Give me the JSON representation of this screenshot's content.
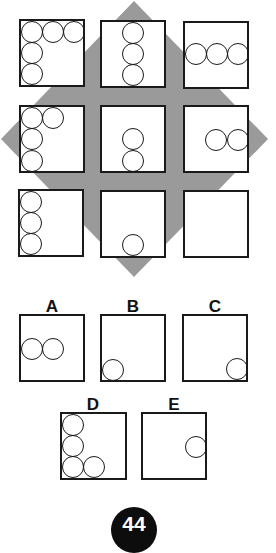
{
  "puzzle": {
    "background_shape": "diamond",
    "diamond_color": "#9a9a9a",
    "grid": [
      {
        "id": "r1c1",
        "circles": [
          "top-left",
          "top-middle",
          "top-right",
          "middle-left",
          "bottom-left"
        ]
      },
      {
        "id": "r1c2",
        "circles": [
          "center-column-top",
          "center-column-middle",
          "center-column-bottom"
        ]
      },
      {
        "id": "r1c3",
        "circles": [
          "middle-row-left",
          "middle-row-center",
          "middle-row-right"
        ]
      },
      {
        "id": "r2c1",
        "circles": [
          "top-left",
          "top-second",
          "middle-left",
          "bottom-left"
        ]
      },
      {
        "id": "r2c2",
        "circles": [
          "center-middle",
          "center-bottom"
        ]
      },
      {
        "id": "r2c3",
        "circles": [
          "middle-center",
          "middle-right"
        ]
      },
      {
        "id": "r3c1",
        "circles": [
          "top-left",
          "middle-left",
          "bottom-left"
        ]
      },
      {
        "id": "r3c2",
        "circles": [
          "bottom-center"
        ]
      },
      {
        "id": "r3c3",
        "circles": [],
        "missing": true
      }
    ]
  },
  "options": [
    {
      "label": "A",
      "circles": [
        "middle-left",
        "middle-second"
      ]
    },
    {
      "label": "B",
      "circles": [
        "bottom-left"
      ]
    },
    {
      "label": "C",
      "circles": [
        "bottom-right"
      ]
    },
    {
      "label": "D",
      "circles": [
        "top-left",
        "middle-left",
        "bottom-left",
        "bottom-second"
      ]
    },
    {
      "label": "E",
      "circles": [
        "middle-right"
      ]
    }
  ],
  "page_number": "44"
}
